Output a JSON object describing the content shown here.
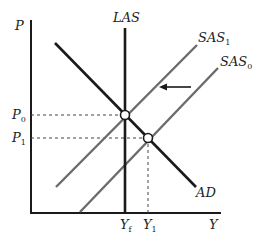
{
  "diagram": {
    "axes": {
      "y_label": "P",
      "x_label": "Y"
    },
    "curves": {
      "las": {
        "label": "LAS"
      },
      "ad": {
        "label": "AD"
      },
      "sas1": {
        "label": "SAS",
        "subscript": "1"
      },
      "sas0": {
        "label": "SAS",
        "subscript": "0"
      }
    },
    "price_levels": [
      {
        "label": "P",
        "subscript": "0"
      },
      {
        "label": "P",
        "subscript": "1"
      }
    ],
    "output_levels": [
      {
        "label": "Y",
        "subscript": "f"
      },
      {
        "label": "Y",
        "subscript": "1"
      }
    ],
    "equilibria": [
      {
        "name": "initial",
        "price": "P0",
        "output": "Yf"
      },
      {
        "name": "new",
        "price": "P1",
        "output": "Y1"
      }
    ],
    "shift_arrow": {
      "direction": "left",
      "meaning": "SAS0 shifts to SAS1"
    },
    "colors": {
      "ad_las": "#1a1a1a",
      "sas": "#6b6b6b",
      "background": "#ffffff"
    }
  }
}
